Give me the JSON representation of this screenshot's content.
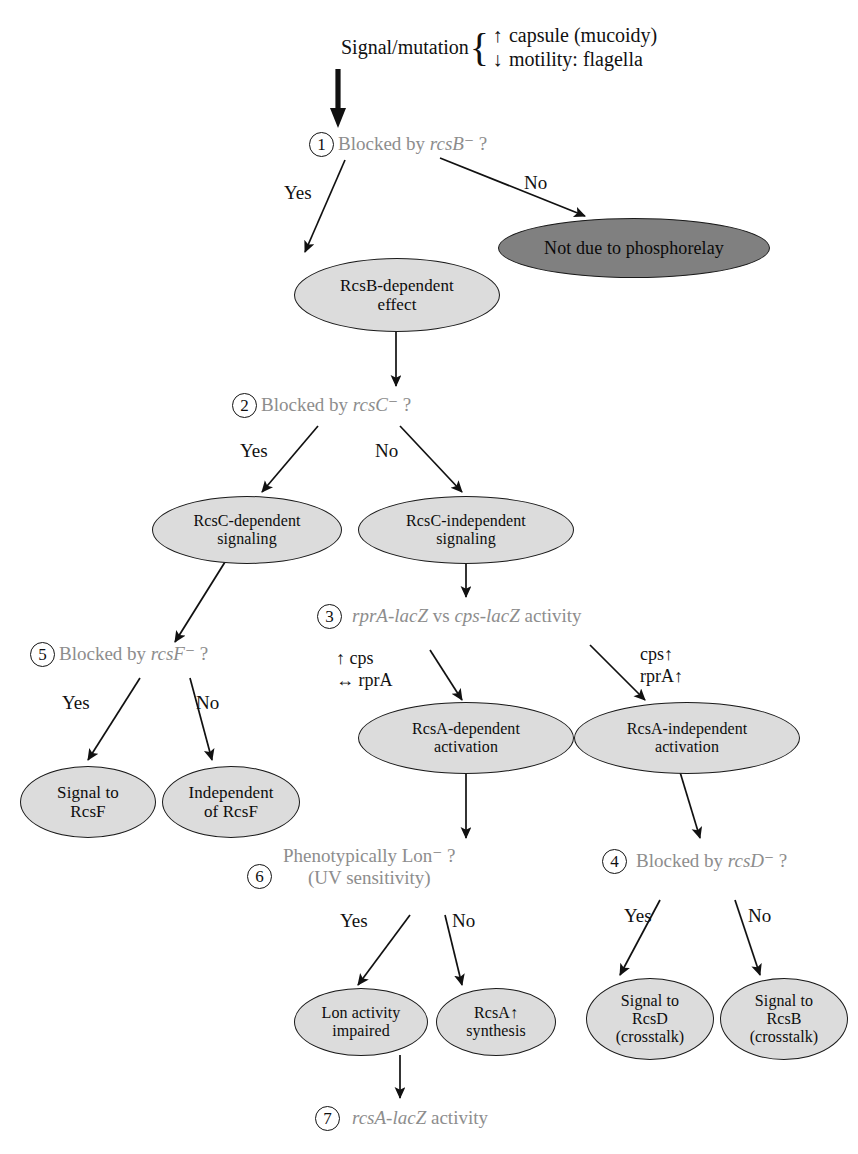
{
  "diagram": {
    "colors": {
      "node_fill_light": "#dcdcdc",
      "node_fill_dark": "#808080",
      "node_stroke": "#1a1a1a",
      "question_text": "#8d8d8d",
      "label_text": "#111111",
      "background": "#ffffff"
    }
  },
  "header": {
    "lead": "Signal/mutation",
    "brace": "{",
    "lines": [
      {
        "symbol": "↑",
        "text": "capsule (mucoidy)"
      },
      {
        "symbol": "↓",
        "text": "motility: flagella"
      }
    ]
  },
  "questions": [
    {
      "num": "1",
      "text_plain": "Blocked by rcsB⁻ ?",
      "prefix": "Blocked by ",
      "gene": "rcsB",
      "suffix": "⁻ ?"
    },
    {
      "num": "2",
      "text_plain": "Blocked by rcsC⁻ ?",
      "prefix": "Blocked by ",
      "gene": "rcsC",
      "suffix": "⁻ ?"
    },
    {
      "num": "5",
      "text_plain": "Blocked by rcsF⁻ ?",
      "prefix": "Blocked by ",
      "gene": "rcsF",
      "suffix": "⁻ ?"
    },
    {
      "num": "3",
      "text_plain": "rprA-lacZ vs cps-lacZ activity",
      "gene_a": "rprA-lacZ",
      "mid": " vs ",
      "gene_b": "cps-lacZ",
      "suffix": " activity"
    },
    {
      "num": "6",
      "line1": "Phenotypically Lon⁻ ?",
      "line2": "(UV sensitivity)"
    },
    {
      "num": "4",
      "text_plain": "Blocked by rcsD⁻ ?",
      "prefix": "Blocked by ",
      "gene": "rcsD",
      "suffix": "⁻ ?"
    },
    {
      "num": "7",
      "gene": "rcsA-lacZ",
      "suffix": " activity"
    }
  ],
  "nodes": [
    {
      "id": "not-due-phosphorelay",
      "label": "Not due to phosphorelay",
      "shade": "dark"
    },
    {
      "id": "rcsb-dependent-effect",
      "label": "RcsB-dependent effect",
      "line1": "RcsB-dependent",
      "line2": "effect",
      "shade": "light"
    },
    {
      "id": "rcsc-dependent-signaling",
      "label": "RcsC-dependent signaling",
      "line1": "RcsC-dependent",
      "line2": "signaling",
      "shade": "light"
    },
    {
      "id": "rcsc-independent-signaling",
      "label": "RcsC-independent signaling",
      "line1": "RcsC-independent",
      "line2": "signaling",
      "shade": "light"
    },
    {
      "id": "signal-to-rcsf",
      "label": "Signal to RcsF",
      "line1": "Signal to",
      "line2": "RcsF",
      "shade": "light"
    },
    {
      "id": "independent-of-rcsf",
      "label": "Independent of RcsF",
      "line1": "Independent",
      "line2": "of RcsF",
      "shade": "light"
    },
    {
      "id": "rcsa-dependent-activation",
      "label": "RcsA-dependent activation",
      "line1": "RcsA-dependent",
      "line2": "activation",
      "shade": "light"
    },
    {
      "id": "rcsa-independent-activation",
      "label": "RcsA-independent activation",
      "line1": "RcsA-independent",
      "line2": "activation",
      "shade": "light"
    },
    {
      "id": "lon-activity-impaired",
      "label": "Lon activity impaired",
      "line1": "Lon activity",
      "line2": "impaired",
      "shade": "light"
    },
    {
      "id": "rcsa-synthesis",
      "label": "RcsA↑ synthesis",
      "line1": "RcsA↑",
      "line2": "synthesis",
      "shade": "light"
    },
    {
      "id": "signal-to-rcsd-crosstalk",
      "label": "Signal to RcsD (crosstalk)",
      "line1": "Signal to",
      "line2": "RcsD",
      "line3": "(crosstalk)",
      "shade": "light"
    },
    {
      "id": "signal-to-rcsb-crosstalk",
      "label": "Signal to RcsB (crosstalk)",
      "line1": "Signal to",
      "line2": "RcsB",
      "line3": "(crosstalk)",
      "shade": "light"
    }
  ],
  "edge_labels": {
    "q1_yes": "Yes",
    "q1_no": "No",
    "q2_yes": "Yes",
    "q2_no": "No",
    "q5_yes": "Yes",
    "q5_no": "No",
    "q6_yes": "Yes",
    "q6_no": "No",
    "q4_yes": "Yes",
    "q4_no": "No",
    "q3_left_line1": "↑ cps",
    "q3_left_line2": "↔ rprA",
    "q3_right_line1": "cps↑",
    "q3_right_line2": "rprA↑"
  }
}
